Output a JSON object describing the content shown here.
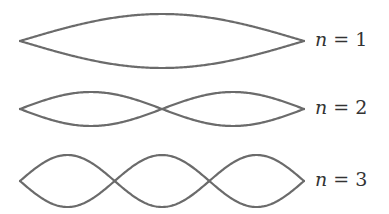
{
  "diagram": {
    "stroke_color": "#6b6b6b",
    "x_start": 20,
    "x_end": 304,
    "modes": [
      {
        "n": 1,
        "label_var": "n",
        "label_eq": " = 1",
        "center_y": 41,
        "amplitude": 27,
        "label_x": 315,
        "label_y": 30
      },
      {
        "n": 2,
        "label_var": "n",
        "label_eq": " = 2",
        "center_y": 109,
        "amplitude": 17,
        "label_x": 315,
        "label_y": 98
      },
      {
        "n": 3,
        "label_var": "n",
        "label_eq": " = 3",
        "center_y": 181,
        "amplitude": 26,
        "label_x": 315,
        "label_y": 170
      }
    ]
  }
}
